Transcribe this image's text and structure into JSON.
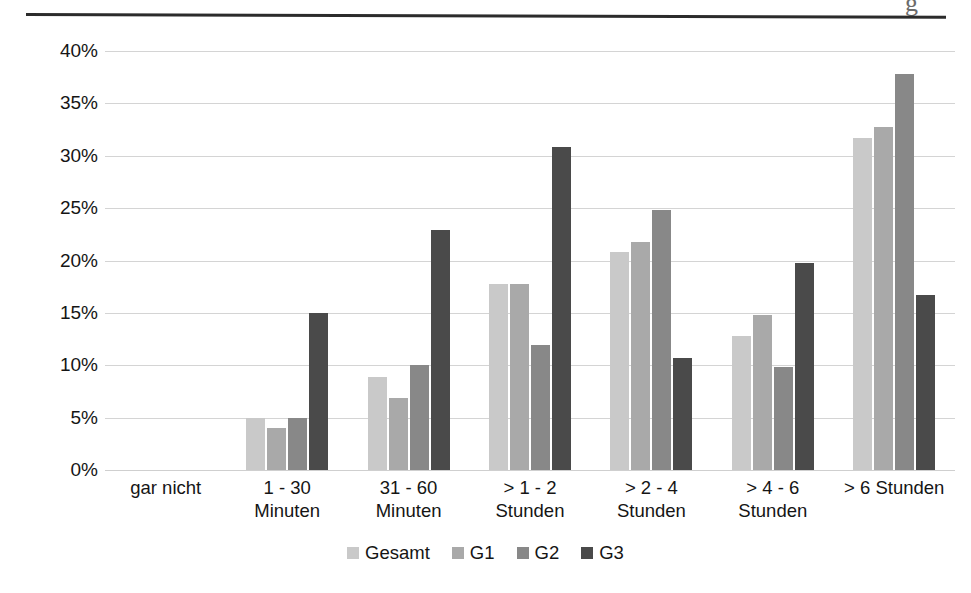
{
  "artifact": {
    "top_descender_glyph": "g"
  },
  "chart_data": {
    "type": "bar",
    "title": "",
    "subtitle": "",
    "xlabel": "",
    "ylabel": "",
    "grid": true,
    "legend_position": "bottom",
    "ylim": [
      0,
      40
    ],
    "yticks": [
      "0%",
      "5%",
      "10%",
      "15%",
      "20%",
      "25%",
      "30%",
      "35%",
      "40%"
    ],
    "ytick_values": [
      0,
      5,
      10,
      15,
      20,
      25,
      30,
      35,
      40
    ],
    "categories": [
      "gar nicht",
      "1 - 30\nMinuten",
      "31 - 60\nMinuten",
      "> 1 - 2\nStunden",
      "> 2 - 4\nStunden",
      "> 4 - 6\nStunden",
      "> 6 Stunden"
    ],
    "series": [
      {
        "name": "Gesamt",
        "color": "#c9c9c9",
        "values": [
          0,
          5.0,
          8.9,
          17.8,
          20.8,
          12.8,
          31.7
        ]
      },
      {
        "name": "G1",
        "color": "#a9a9a9",
        "values": [
          0,
          4.0,
          6.9,
          17.8,
          21.8,
          14.8,
          32.7
        ]
      },
      {
        "name": "G2",
        "color": "#888888",
        "values": [
          0,
          5.0,
          10.0,
          11.9,
          24.8,
          9.8,
          37.8
        ]
      },
      {
        "name": "G3",
        "color": "#4a4a4a",
        "values": [
          0,
          15.0,
          22.9,
          30.8,
          10.7,
          19.8,
          16.7
        ]
      }
    ]
  }
}
